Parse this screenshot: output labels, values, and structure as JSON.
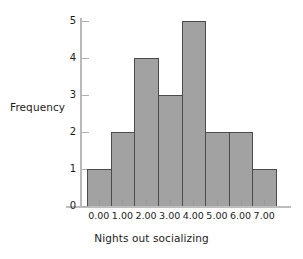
{
  "chart_data": {
    "type": "bar",
    "title": "",
    "subtitle": "",
    "xlabel": "Nights out socializing",
    "ylabel": "Frequency",
    "categories": [
      "0.00",
      "1.00",
      "2.00",
      "3.00",
      "4.00",
      "5.00",
      "6.00",
      "7.00"
    ],
    "values": [
      1,
      2,
      4,
      3,
      5,
      2,
      2,
      1
    ],
    "xtick_labels": [
      "0.00",
      "1.00",
      "2.00",
      "3.00",
      "4.00",
      "5.00",
      "6.00",
      "7.00"
    ],
    "ytick_labels": [
      "0",
      "1",
      "2",
      "3",
      "4",
      "5"
    ],
    "ytick_values": [
      0,
      1,
      2,
      3,
      4,
      5
    ],
    "ylim": [
      0,
      5
    ],
    "grid": false,
    "legend": false,
    "legend_position": "none",
    "bar_fill_color": "#a2a2a2",
    "bar_edge_color": "#4b4b4b",
    "axis_color": "#b9b9b9",
    "text_color": "#1c1c1c",
    "background_color": "#ffffff",
    "annotations": []
  }
}
